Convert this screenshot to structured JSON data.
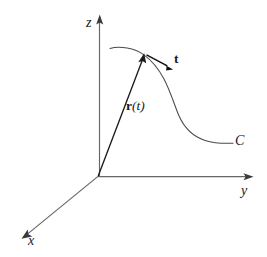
{
  "figure": {
    "background_color": "#ffffff",
    "width": 267,
    "height": 257
  },
  "axes": {
    "origin": {
      "x": 98,
      "y": 176
    },
    "items": [
      {
        "name": "z",
        "label": "z",
        "direction": "up",
        "tip": {
          "x": 100,
          "y": 15
        },
        "color": "#666666"
      },
      {
        "name": "y",
        "label": "y",
        "direction": "right",
        "tip": {
          "x": 253,
          "y": 177
        },
        "color": "#666666"
      },
      {
        "name": "x",
        "label": "x",
        "direction": "down-left",
        "tip": {
          "x": 22,
          "y": 238
        },
        "color": "#666666"
      }
    ]
  },
  "curve": {
    "label": "C",
    "color": "#4a4a4a",
    "start": {
      "x": 110,
      "y": 48
    },
    "end": {
      "x": 233,
      "y": 143
    },
    "label_position": {
      "x": 235,
      "y": 134
    },
    "description": "S-shaped space curve rising to a crest then descending and flattening"
  },
  "position_vector": {
    "label": "r(t)",
    "bold_symbol": "r",
    "argument": "(t)",
    "color": "#1c1c1c",
    "from": {
      "x": 98,
      "y": 176
    },
    "to": {
      "x": 143,
      "y": 55
    },
    "label_position": {
      "x": 126,
      "y": 99
    }
  },
  "tangent_vector": {
    "label": "t",
    "color": "#0f0f0f",
    "from": {
      "x": 146,
      "y": 54
    },
    "to": {
      "x": 172,
      "y": 69
    },
    "label_position": {
      "x": 174,
      "y": 52
    }
  }
}
